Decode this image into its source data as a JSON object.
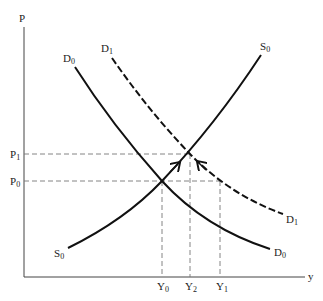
{
  "diagram": {
    "type": "supply-demand",
    "axes": {
      "y_axis_label": "P",
      "x_axis_label": "y"
    },
    "price_levels": [
      {
        "label": "P",
        "sub": "1"
      },
      {
        "label": "P",
        "sub": "0"
      }
    ],
    "quantity_levels": [
      {
        "label": "Y",
        "sub": "0"
      },
      {
        "label": "Y",
        "sub": "2"
      },
      {
        "label": "Y",
        "sub": "1"
      }
    ],
    "curves": [
      {
        "name": "D",
        "sub": "0",
        "style": "solid",
        "end_label": {
          "text": "D",
          "sub": "0"
        }
      },
      {
        "name": "D",
        "sub": "1",
        "style": "dashed",
        "end_label": {
          "text": "D",
          "sub": "1"
        }
      },
      {
        "name": "S",
        "sub": "0",
        "style": "solid",
        "end_label": {
          "text": "S",
          "sub": "0"
        }
      }
    ],
    "colors": {
      "line": "#111111",
      "guide": "#777777",
      "background": "#ffffff"
    }
  }
}
